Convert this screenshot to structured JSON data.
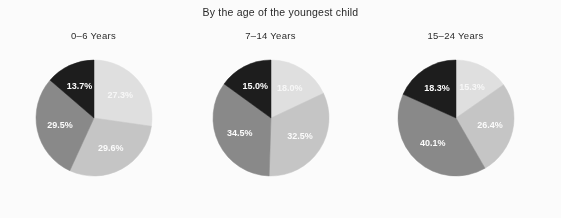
{
  "chart_data": {
    "type": "pie",
    "title": "By the age of the youngest child",
    "xlabel": "",
    "ylabel": "",
    "legend": "none",
    "grid": false,
    "label_format": "percent_one_decimal",
    "slice_order": "clockwise from 12 o'clock",
    "colors": [
      "#e3e3e3",
      "#c8c8c8",
      "#8b8b8b",
      "#1d1d1d"
    ],
    "panels": [
      {
        "title": "0–6 Years",
        "categories": [
          "Slice 1",
          "Slice 2",
          "Slice 3",
          "Slice 4"
        ],
        "values": [
          27.3,
          29.6,
          29.5,
          13.7
        ],
        "labels": [
          "27.3%",
          "29.6%",
          "29.5%",
          "13.7%"
        ]
      },
      {
        "title": "7–14 Years",
        "categories": [
          "Slice 1",
          "Slice 2",
          "Slice 3",
          "Slice 4"
        ],
        "values": [
          18.0,
          32.5,
          34.5,
          15.0
        ],
        "labels": [
          "18.0%",
          "32.5%",
          "34.5%",
          "15.0%"
        ]
      },
      {
        "title": "15–24 Years",
        "categories": [
          "Slice 1",
          "Slice 2",
          "Slice 3",
          "Slice 4"
        ],
        "values": [
          15.3,
          26.4,
          40.1,
          18.3
        ],
        "labels": [
          "15.3%",
          "26.4%",
          "40.1%",
          "18.3%"
        ]
      }
    ]
  }
}
